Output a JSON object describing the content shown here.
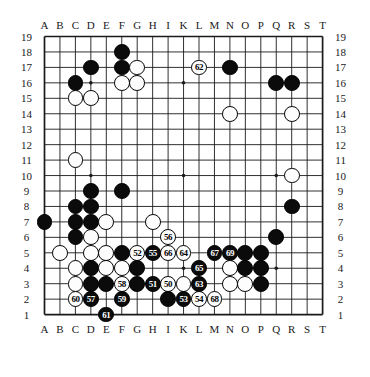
{
  "figure": {
    "kind": "go-board-diagram",
    "board_size": 19,
    "title": "",
    "colors": {
      "black_stone": "#0b0b0b",
      "white_stone": "#fdfdfd",
      "grid_line": "#1a1a1a",
      "background": "#ffffff"
    }
  },
  "axes": {
    "columns": [
      "A",
      "B",
      "C",
      "D",
      "E",
      "F",
      "G",
      "H",
      "I",
      "K",
      "L",
      "M",
      "N",
      "O",
      "P",
      "Q",
      "R",
      "S",
      "T"
    ],
    "rows": [
      "19",
      "18",
      "17",
      "16",
      "15",
      "14",
      "13",
      "12",
      "11",
      "10",
      "9",
      "8",
      "7",
      "6",
      "5",
      "4",
      "3",
      "2",
      "1"
    ],
    "column_labels_top": true,
    "column_labels_bottom": true,
    "row_labels_left": true,
    "row_labels_right": true
  },
  "chart_data": {
    "type": "table",
    "xlabel": "column",
    "ylabel": "row",
    "star_points": [
      {
        "col": "D",
        "row": 16
      },
      {
        "col": "K",
        "row": 16
      },
      {
        "col": "Q",
        "row": 16
      },
      {
        "col": "D",
        "row": 10
      },
      {
        "col": "K",
        "row": 10
      },
      {
        "col": "Q",
        "row": 10
      },
      {
        "col": "D",
        "row": 4
      },
      {
        "col": "K",
        "row": 4
      },
      {
        "col": "Q",
        "row": 4
      }
    ],
    "stones": [
      {
        "col": "F",
        "row": 18,
        "color": "black",
        "label": ""
      },
      {
        "col": "D",
        "row": 17,
        "color": "black",
        "label": ""
      },
      {
        "col": "F",
        "row": 17,
        "color": "black",
        "label": ""
      },
      {
        "col": "G",
        "row": 17,
        "color": "white",
        "label": ""
      },
      {
        "col": "L",
        "row": 17,
        "color": "white",
        "label": "62"
      },
      {
        "col": "N",
        "row": 17,
        "color": "black",
        "label": ""
      },
      {
        "col": "C",
        "row": 16,
        "color": "black",
        "label": ""
      },
      {
        "col": "F",
        "row": 16,
        "color": "white",
        "label": ""
      },
      {
        "col": "G",
        "row": 16,
        "color": "white",
        "label": ""
      },
      {
        "col": "Q",
        "row": 16,
        "color": "black",
        "label": ""
      },
      {
        "col": "R",
        "row": 16,
        "color": "black",
        "label": ""
      },
      {
        "col": "C",
        "row": 15,
        "color": "white",
        "label": ""
      },
      {
        "col": "D",
        "row": 15,
        "color": "white",
        "label": ""
      },
      {
        "col": "N",
        "row": 14,
        "color": "white",
        "label": ""
      },
      {
        "col": "R",
        "row": 14,
        "color": "white",
        "label": ""
      },
      {
        "col": "C",
        "row": 11,
        "color": "white",
        "label": ""
      },
      {
        "col": "R",
        "row": 10,
        "color": "white",
        "label": ""
      },
      {
        "col": "D",
        "row": 9,
        "color": "black",
        "label": ""
      },
      {
        "col": "F",
        "row": 9,
        "color": "black",
        "label": ""
      },
      {
        "col": "C",
        "row": 8,
        "color": "black",
        "label": ""
      },
      {
        "col": "D",
        "row": 8,
        "color": "black",
        "label": ""
      },
      {
        "col": "R",
        "row": 8,
        "color": "black",
        "label": ""
      },
      {
        "col": "A",
        "row": 7,
        "color": "black",
        "label": ""
      },
      {
        "col": "C",
        "row": 7,
        "color": "black",
        "label": ""
      },
      {
        "col": "D",
        "row": 7,
        "color": "black",
        "label": ""
      },
      {
        "col": "E",
        "row": 7,
        "color": "white",
        "label": ""
      },
      {
        "col": "H",
        "row": 7,
        "color": "white",
        "label": ""
      },
      {
        "col": "C",
        "row": 6,
        "color": "black",
        "label": ""
      },
      {
        "col": "D",
        "row": 6,
        "color": "white",
        "label": ""
      },
      {
        "col": "I",
        "row": 6,
        "color": "white",
        "label": "56"
      },
      {
        "col": "Q",
        "row": 6,
        "color": "black",
        "label": ""
      },
      {
        "col": "B",
        "row": 5,
        "color": "white",
        "label": ""
      },
      {
        "col": "D",
        "row": 5,
        "color": "white",
        "label": ""
      },
      {
        "col": "E",
        "row": 5,
        "color": "white",
        "label": ""
      },
      {
        "col": "F",
        "row": 5,
        "color": "black",
        "label": ""
      },
      {
        "col": "G",
        "row": 5,
        "color": "white",
        "label": "52"
      },
      {
        "col": "H",
        "row": 5,
        "color": "black",
        "label": "55"
      },
      {
        "col": "I",
        "row": 5,
        "color": "white",
        "label": "66"
      },
      {
        "col": "K",
        "row": 5,
        "color": "white",
        "label": "64"
      },
      {
        "col": "M",
        "row": 5,
        "color": "black",
        "label": "67"
      },
      {
        "col": "N",
        "row": 5,
        "color": "black",
        "label": "69"
      },
      {
        "col": "O",
        "row": 5,
        "color": "black",
        "label": ""
      },
      {
        "col": "P",
        "row": 5,
        "color": "black",
        "label": ""
      },
      {
        "col": "C",
        "row": 4,
        "color": "white",
        "label": ""
      },
      {
        "col": "D",
        "row": 4,
        "color": "black",
        "label": ""
      },
      {
        "col": "E",
        "row": 4,
        "color": "white",
        "label": ""
      },
      {
        "col": "F",
        "row": 4,
        "color": "white",
        "label": ""
      },
      {
        "col": "G",
        "row": 4,
        "color": "black",
        "label": ""
      },
      {
        "col": "L",
        "row": 4,
        "color": "black",
        "label": "65"
      },
      {
        "col": "N",
        "row": 4,
        "color": "white",
        "label": ""
      },
      {
        "col": "O",
        "row": 4,
        "color": "black",
        "label": ""
      },
      {
        "col": "P",
        "row": 4,
        "color": "black",
        "label": ""
      },
      {
        "col": "C",
        "row": 3,
        "color": "white",
        "label": ""
      },
      {
        "col": "D",
        "row": 3,
        "color": "black",
        "label": ""
      },
      {
        "col": "E",
        "row": 3,
        "color": "black",
        "label": ""
      },
      {
        "col": "F",
        "row": 3,
        "color": "white",
        "label": "58"
      },
      {
        "col": "G",
        "row": 3,
        "color": "black",
        "label": ""
      },
      {
        "col": "H",
        "row": 3,
        "color": "black",
        "label": "51"
      },
      {
        "col": "I",
        "row": 3,
        "color": "white",
        "label": "50"
      },
      {
        "col": "K",
        "row": 3,
        "color": "white",
        "label": ""
      },
      {
        "col": "L",
        "row": 3,
        "color": "black",
        "label": "63"
      },
      {
        "col": "N",
        "row": 3,
        "color": "white",
        "label": ""
      },
      {
        "col": "O",
        "row": 3,
        "color": "white",
        "label": ""
      },
      {
        "col": "P",
        "row": 3,
        "color": "black",
        "label": ""
      },
      {
        "col": "C",
        "row": 2,
        "color": "white",
        "label": "60"
      },
      {
        "col": "D",
        "row": 2,
        "color": "black",
        "label": "57"
      },
      {
        "col": "F",
        "row": 2,
        "color": "black",
        "label": "59"
      },
      {
        "col": "I",
        "row": 2,
        "color": "black",
        "label": ""
      },
      {
        "col": "K",
        "row": 2,
        "color": "black",
        "label": "53"
      },
      {
        "col": "L",
        "row": 2,
        "color": "white",
        "label": "54"
      },
      {
        "col": "M",
        "row": 2,
        "color": "white",
        "label": "68"
      },
      {
        "col": "E",
        "row": 1,
        "color": "black",
        "label": "61"
      }
    ],
    "move_numbers": [
      "50",
      "51",
      "52",
      "53",
      "54",
      "55",
      "56",
      "57",
      "58",
      "59",
      "60",
      "61",
      "62",
      "63",
      "64",
      "65",
      "66",
      "67",
      "68",
      "69"
    ]
  }
}
